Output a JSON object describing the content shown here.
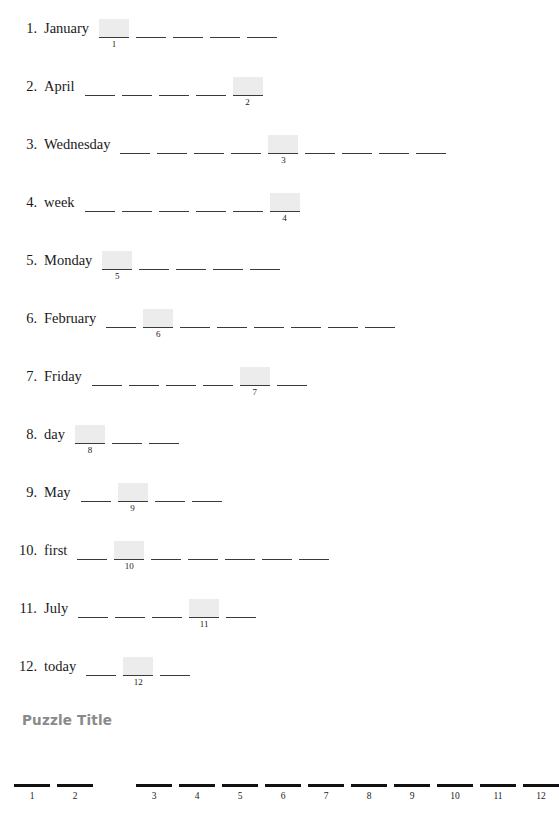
{
  "document": {
    "type": "word-scramble-worksheet",
    "highlight_color": "#ececec",
    "rule_color": "#3a3a3a",
    "answer_rule_color": "#111111"
  },
  "clues": [
    {
      "number": "1.",
      "word": "January",
      "blank_count": 5,
      "highlight_index": 1,
      "highlight_label": "1"
    },
    {
      "number": "2.",
      "word": "April",
      "blank_count": 5,
      "highlight_index": 5,
      "highlight_label": "2"
    },
    {
      "number": "3.",
      "word": "Wednesday",
      "blank_count": 9,
      "highlight_index": 5,
      "highlight_label": "3"
    },
    {
      "number": "4.",
      "word": "week",
      "blank_count": 6,
      "highlight_index": 6,
      "highlight_label": "4"
    },
    {
      "number": "5.",
      "word": "Monday",
      "blank_count": 5,
      "highlight_index": 1,
      "highlight_label": "5"
    },
    {
      "number": "6.",
      "word": "February",
      "blank_count": 8,
      "highlight_index": 2,
      "highlight_label": "6"
    },
    {
      "number": "7.",
      "word": "Friday",
      "blank_count": 6,
      "highlight_index": 5,
      "highlight_label": "7"
    },
    {
      "number": "8.",
      "word": "day",
      "blank_count": 3,
      "highlight_index": 1,
      "highlight_label": "8"
    },
    {
      "number": "9.",
      "word": "May",
      "blank_count": 4,
      "highlight_index": 2,
      "highlight_label": "9"
    },
    {
      "number": "10.",
      "word": "first",
      "blank_count": 7,
      "highlight_index": 2,
      "highlight_label": "10"
    },
    {
      "number": "11.",
      "word": "July",
      "blank_count": 5,
      "highlight_index": 4,
      "highlight_label": "11"
    },
    {
      "number": "12.",
      "word": "today",
      "blank_count": 3,
      "highlight_index": 2,
      "highlight_label": "12"
    }
  ],
  "puzzle": {
    "title": "Puzzle Title",
    "answer_slots": [
      {
        "label": "1",
        "gap_after": false
      },
      {
        "label": "2",
        "gap_after": true
      },
      {
        "label": "3",
        "gap_after": false
      },
      {
        "label": "4",
        "gap_after": false
      },
      {
        "label": "5",
        "gap_after": false
      },
      {
        "label": "6",
        "gap_after": false
      },
      {
        "label": "7",
        "gap_after": false
      },
      {
        "label": "8",
        "gap_after": false
      },
      {
        "label": "9",
        "gap_after": false
      },
      {
        "label": "10",
        "gap_after": false
      },
      {
        "label": "11",
        "gap_after": false
      },
      {
        "label": "12",
        "gap_after": false
      }
    ]
  }
}
